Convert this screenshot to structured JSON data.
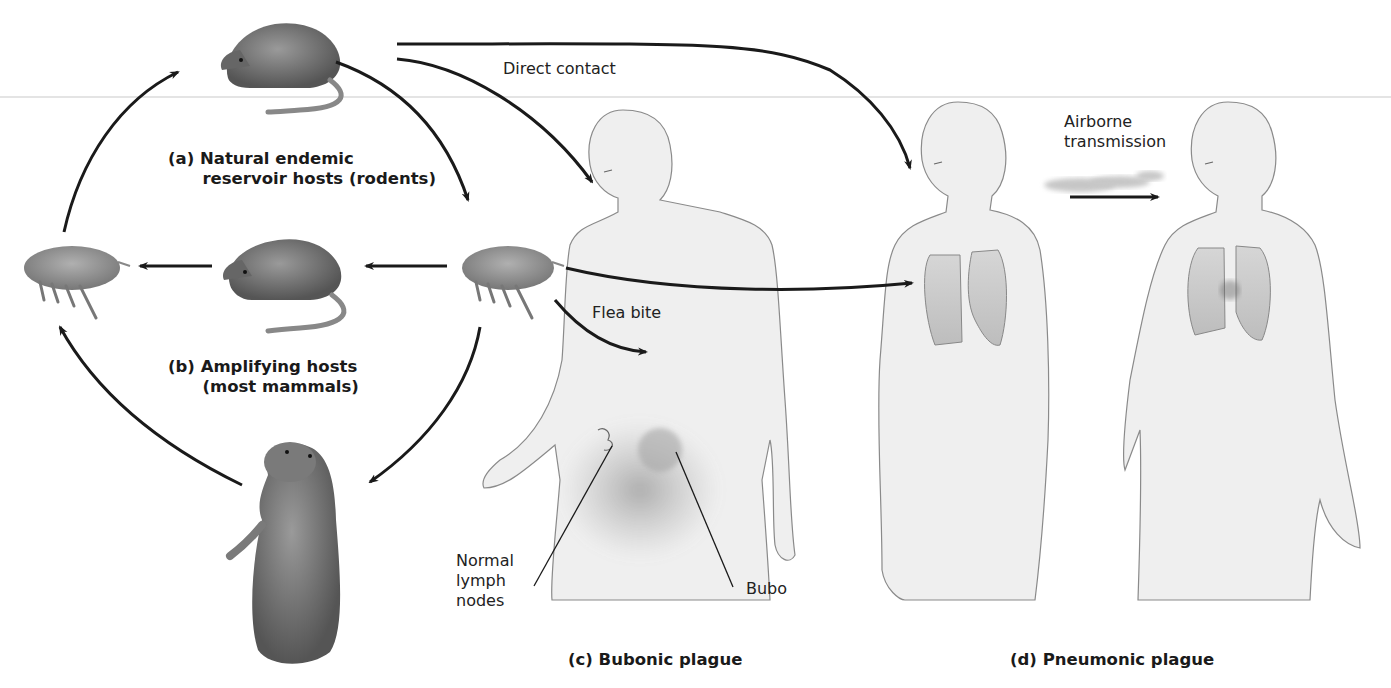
{
  "figure": {
    "panels": {
      "a": {
        "label": "(a) Natural endemic\n      reservoir hosts (rodents)"
      },
      "b": {
        "label": "(b) Amplifying hosts\n      (most mammals)"
      },
      "c": {
        "label": "(c) Bubonic plague"
      },
      "d": {
        "label": "(d) Pneumonic plague"
      }
    },
    "annotations": {
      "direct_contact": "Direct contact",
      "airborne": "Airborne\ntransmission",
      "flea_bite": "Flea bite",
      "normal_lymph_nodes": "Normal\nlymph\nnodes",
      "bubo": "Bubo"
    },
    "colors": {
      "ink": "#1a1a1a",
      "skin": "#efefef",
      "outline": "#777777",
      "animal": "#6e6e6e",
      "lung": "#cfcfcf"
    }
  }
}
